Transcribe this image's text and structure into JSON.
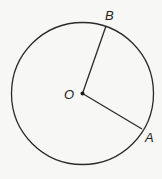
{
  "diagram": {
    "type": "circle-with-radii",
    "background": "#f7f7f5",
    "stroke_color": "#2a2a2a",
    "circle": {
      "cx": 82.5,
      "cy": 93.5,
      "r": 71
    },
    "center": {
      "label": "O",
      "x": 82.5,
      "y": 93.5
    },
    "points": [
      {
        "label": "B",
        "x": 106,
        "y": 26
      },
      {
        "label": "A",
        "x": 142,
        "y": 129
      }
    ],
    "segments": [
      {
        "from": "O",
        "to": "B"
      },
      {
        "from": "O",
        "to": "A"
      }
    ]
  }
}
